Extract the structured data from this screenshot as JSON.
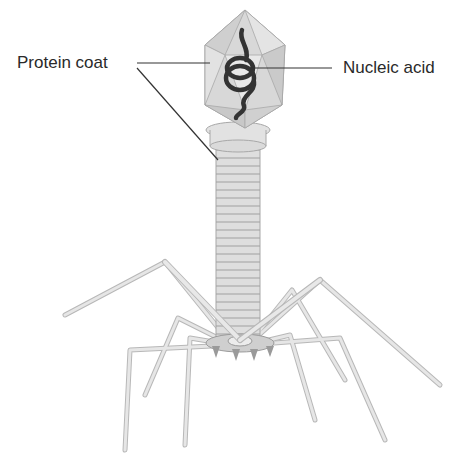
{
  "diagram": {
    "labels": {
      "protein_coat": "Protein coat",
      "nucleic_acid": "Nucleic acid"
    },
    "colors": {
      "structure_fill": "#dcdcdc",
      "structure_stroke": "#9a9a9a",
      "nucleic_acid": "#3a3a3a",
      "leader_line": "#333333",
      "label_text": "#2a2a2a"
    }
  }
}
